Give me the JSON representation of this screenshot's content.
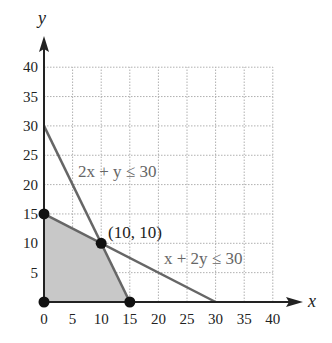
{
  "chart_data": {
    "type": "line",
    "title": "",
    "xlabel": "x",
    "ylabel": "y",
    "xlim": [
      0,
      40
    ],
    "ylim": [
      0,
      40
    ],
    "grid": true,
    "x_ticks": [
      "0",
      "5",
      "10",
      "15",
      "20",
      "25",
      "30",
      "35",
      "40"
    ],
    "y_ticks": [
      "5",
      "10",
      "15",
      "20",
      "25",
      "30",
      "35",
      "40"
    ],
    "series": [
      {
        "name": "2x + y ≤ 30",
        "points": [
          [
            0,
            30
          ],
          [
            15,
            0
          ]
        ]
      },
      {
        "name": "x + 2y ≤ 30",
        "points": [
          [
            0,
            15
          ],
          [
            30,
            0
          ]
        ]
      }
    ],
    "feasible_region": [
      [
        0,
        0
      ],
      [
        0,
        15
      ],
      [
        10,
        10
      ],
      [
        15,
        0
      ]
    ],
    "vertices": [
      [
        0,
        0
      ],
      [
        0,
        15
      ],
      [
        10,
        10
      ],
      [
        15,
        0
      ]
    ],
    "annotations": [
      {
        "text": "2x + y ≤ 30",
        "at": [
          12,
          24
        ]
      },
      {
        "text": "x + 2y ≤ 30",
        "at": [
          23,
          8
        ]
      },
      {
        "text": "(10, 10)",
        "at": [
          11,
          11
        ]
      }
    ],
    "colors": {
      "region": "#c8c8c8",
      "boundary": "#666666",
      "grid": "#b0b0b0",
      "axis": "#222222",
      "label": "#666666"
    }
  },
  "labels": {
    "x_axis": "x",
    "y_axis": "y",
    "line1": "2x + y ≤ 30",
    "line2": "x + 2y ≤ 30",
    "point": "(10, 10)"
  }
}
